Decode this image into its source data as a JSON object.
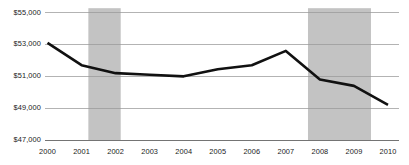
{
  "chart_data": {
    "type": "line",
    "title": "",
    "subtitle": "",
    "xlabel": "",
    "ylabel": "",
    "x": [
      2000,
      2001,
      2002,
      2003,
      2004,
      2005,
      2006,
      2007,
      2008,
      2009,
      2010
    ],
    "categories": [
      "2000",
      "2001",
      "2002",
      "2003",
      "2004",
      "2005",
      "2006",
      "2007",
      "2008",
      "2009",
      "2010"
    ],
    "values": [
      53100,
      51700,
      51200,
      51100,
      51000,
      51450,
      51700,
      52600,
      50800,
      50400,
      49200
    ],
    "series": [
      {
        "name": "Median household income",
        "values": [
          53100,
          51700,
          51200,
          51100,
          51000,
          51450,
          51700,
          52600,
          50800,
          50400,
          49200
        ]
      }
    ],
    "ylim": [
      47000,
      55000
    ],
    "yticks": [
      47000,
      49000,
      51000,
      53000,
      55000
    ],
    "ytick_labels": [
      "$47,000",
      "$49,000",
      "$51,000",
      "$53,000",
      "$55,000"
    ],
    "xtick_labels": [
      "2000",
      "2001",
      "2002",
      "2003",
      "2004",
      "2005",
      "2006",
      "2007",
      "2008",
      "2009",
      "2010"
    ],
    "grid": true,
    "grid_axis": "y",
    "legend": false,
    "legend_position": "none",
    "annotations": [
      {
        "type": "shaded-band",
        "name": "recession-band-2001",
        "x_start": 2001.2,
        "x_end": 2002.15,
        "label": ""
      },
      {
        "type": "shaded-band",
        "name": "recession-band-2008",
        "x_start": 2007.65,
        "x_end": 2009.5,
        "label": ""
      }
    ],
    "colors": {
      "line": "#111111",
      "grid": "#9a9a9a",
      "axis": "#6f6f6f",
      "band": "#c3c3c3",
      "text": "#1a1a1a",
      "background": "#ffffff"
    },
    "line_width": 2.6
  }
}
